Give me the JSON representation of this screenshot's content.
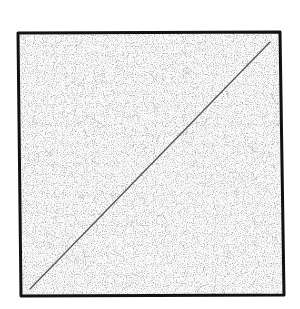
{
  "canvas": {
    "width": 300,
    "height": 309,
    "background": "#ffffff"
  },
  "square": {
    "shape": "hand-drawn-square",
    "corners": {
      "tl": [
        18,
        33
      ],
      "tr": [
        280,
        32
      ],
      "br": [
        284,
        295
      ],
      "bl": [
        21,
        296
      ]
    },
    "stroke": "#111111",
    "stroke_width": 3,
    "fill": "#fbfbfb",
    "texture": "paper-speckle"
  },
  "diagonal": {
    "shape": "line",
    "from": [
      30,
      289
    ],
    "to": [
      270,
      42
    ],
    "stroke": "#555555",
    "stroke_width": 1.3
  }
}
